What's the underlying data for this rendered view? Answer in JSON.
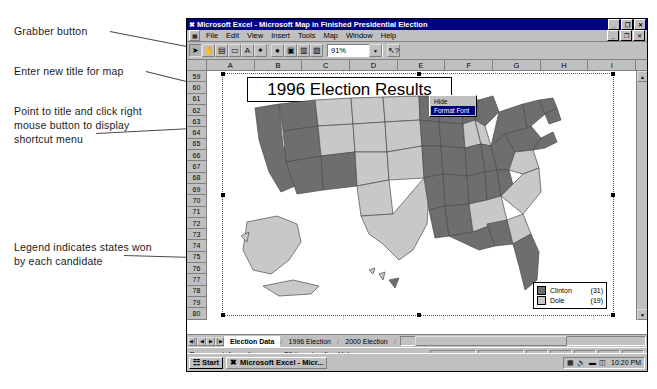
{
  "annotations": [
    {
      "id": "grabber",
      "text": "Grabber button",
      "x": 14,
      "y": 24
    },
    {
      "id": "title",
      "text": "Enter new title for map",
      "x": 14,
      "y": 64
    },
    {
      "id": "shortcut",
      "text": "Point to title and click right\nmouse button to display\nshortcut menu",
      "x": 14,
      "y": 104
    },
    {
      "id": "legend",
      "text": "Legend indicates states won\nby each candidate",
      "x": 14,
      "y": 240
    }
  ],
  "window": {
    "title": "Microsoft Excel - Microsoft Map in Finished Presidential Election",
    "app_icon": "excel-x-icon",
    "controls_outer": [
      "minimize",
      "restore",
      "close"
    ],
    "controls_inner": [
      "minimize",
      "restore",
      "close"
    ],
    "control_glyphs": {
      "minimize": "_",
      "restore": "❐",
      "close": "✕"
    }
  },
  "menu": {
    "app_button_icon": "map-document-icon",
    "items": [
      "File",
      "Edit",
      "View",
      "Insert",
      "Tools",
      "Map",
      "Window",
      "Help"
    ]
  },
  "toolbar": {
    "buttons": [
      {
        "name": "select-arrow-tool",
        "glyph": "➤",
        "pressed": true
      },
      {
        "name": "grabber-hand-tool",
        "glyph": "✋",
        "pressed": false
      },
      {
        "name": "map-labeler-tool",
        "glyph": "▤",
        "pressed": false
      },
      {
        "name": "text-label-tool",
        "glyph": "▭",
        "pressed": false
      },
      {
        "name": "add-text-tool",
        "glyph": "A",
        "pressed": false
      },
      {
        "name": "custom-pin-tool",
        "glyph": "✦",
        "pressed": false
      },
      {
        "name": "map-refresh-tool",
        "glyph": "●",
        "pressed": false
      },
      {
        "name": "show-hide-legend-tool",
        "glyph": "▣",
        "pressed": false
      },
      {
        "name": "data-map-control-tool",
        "glyph": "▥",
        "pressed": false
      },
      {
        "name": "add-feature-tool",
        "glyph": "▧",
        "pressed": false
      }
    ],
    "zoom_value": "91%",
    "zoom_arrow_glyph": "▼",
    "help_button": {
      "name": "help-pointer-button",
      "glyph": "↖?"
    }
  },
  "grid": {
    "columns": [
      "A",
      "B",
      "C",
      "D",
      "E",
      "F",
      "G",
      "H",
      "I"
    ],
    "rows": [
      "59",
      "60",
      "61",
      "62",
      "63",
      "64",
      "65",
      "66",
      "67",
      "68",
      "69",
      "70",
      "71",
      "72",
      "73",
      "74",
      "75",
      "76",
      "77",
      "78",
      "79",
      "80"
    ]
  },
  "map": {
    "title_text": "1996 Election Results",
    "context_menu": {
      "items": [
        {
          "label": "Hide",
          "selected": false
        },
        {
          "label": "Format Font",
          "selected": true
        }
      ]
    },
    "legend": {
      "entries": [
        {
          "name": "Clinton",
          "count": "(31)",
          "color": "#6e6e6e"
        },
        {
          "name": "Dole",
          "count": "(19)",
          "color": "#c8c8c8"
        }
      ]
    }
  },
  "chart_data": {
    "type": "map",
    "title": "1996 Election Results",
    "categories": [
      "Clinton",
      "Dole"
    ],
    "values": [
      31,
      19
    ],
    "colors": [
      "#6e6e6e",
      "#c8c8c8"
    ],
    "legend_position": "bottom-right"
  },
  "sheet_tabs": {
    "nav_glyphs": [
      "◀│",
      "◀",
      "▶",
      "│▶"
    ],
    "tabs": [
      {
        "label": "Election Data",
        "active": true
      },
      {
        "label": "1996 Election",
        "active": false
      },
      {
        "label": "2000 Election",
        "active": false
      }
    ]
  },
  "statusbar": {
    "message": "For more information, press F1 to get online Help."
  },
  "taskbar": {
    "start_label": "Start",
    "start_icon": "windows-flag-icon",
    "task_label": "Microsoft Excel - Micr...",
    "task_icon": "excel-x-icon",
    "tray_icons": [
      "network-icon",
      "volume-icon",
      "display-icon",
      "battery-icon"
    ],
    "clock": "10:20 PM"
  },
  "scroll": {
    "up_glyph": "▲",
    "down_glyph": "▼",
    "left_glyph": "◀",
    "right_glyph": "▶"
  }
}
